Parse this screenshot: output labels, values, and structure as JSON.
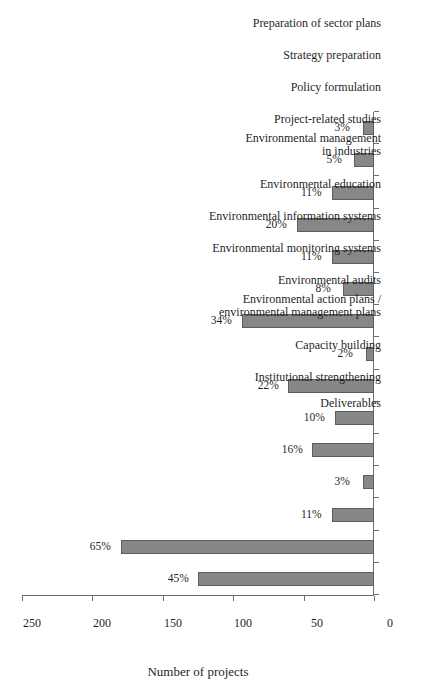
{
  "chart_data": {
    "type": "bar",
    "title": "",
    "subtitle": "",
    "orientation": "vertical-bars-on-rotated-page",
    "xlabel": "Deliverables",
    "ylabel": "Number of projects",
    "ylim": [
      0,
      250
    ],
    "yticks": [
      0,
      50,
      100,
      150,
      200,
      250
    ],
    "ytick_labels": [
      "0",
      "50",
      "100",
      "150",
      "200",
      "250"
    ],
    "grid": false,
    "legend": null,
    "bar_color": "#878787",
    "bar_edge_color": "#5d5d5d",
    "axis_color": "#6f6f6f",
    "background_color": "#ffffff",
    "categories": [
      "Institutional strengthening",
      "Capacity building",
      "Environmental action plans /\nenvironmental management plans",
      "Environmental audits",
      "Environmental monitoring systems",
      "Environmental information systems",
      "Environmental education",
      "Environmental management\nin industries",
      "Project-related studies",
      "Policy formulation",
      "Strategy preparation",
      "Preparation of sector plans",
      "Private sector development",
      "Support for civil society\ninvolvement",
      "Environmental / pollution\ncontrol fund"
    ],
    "percent_labels": [
      "45%",
      "65%",
      "11%",
      "3%",
      "16%",
      "10%",
      "22%",
      "2%",
      "34%",
      "8%",
      "11%",
      "20%",
      "11%",
      "5%",
      "3%"
    ],
    "percent_values": [
      45,
      65,
      11,
      3,
      16,
      10,
      22,
      2,
      34,
      8,
      11,
      20,
      11,
      5,
      3
    ],
    "values": [
      125,
      180,
      30,
      8,
      44,
      28,
      61,
      6,
      94,
      22,
      30,
      55,
      30,
      14,
      8
    ]
  },
  "axes": {
    "value_axis_title": "Number of projects",
    "category_axis_title": "Deliverables"
  }
}
